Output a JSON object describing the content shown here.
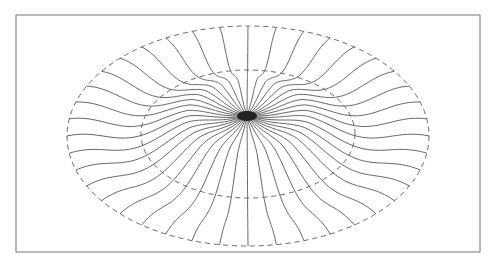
{
  "figure": {
    "frame": {
      "x": 16,
      "y": 15,
      "w": 464,
      "h": 237
    },
    "center": {
      "x": 247,
      "y": 116
    },
    "outer_ellipse": {
      "cx": 248,
      "cy": 136,
      "rx": 181,
      "ry": 110
    },
    "inner_ellipse": {
      "cx": 248,
      "cy": 134,
      "rx": 107,
      "ry": 64
    },
    "line_count": 40,
    "stroke_color": "#555555",
    "dash_color": "#666666"
  }
}
